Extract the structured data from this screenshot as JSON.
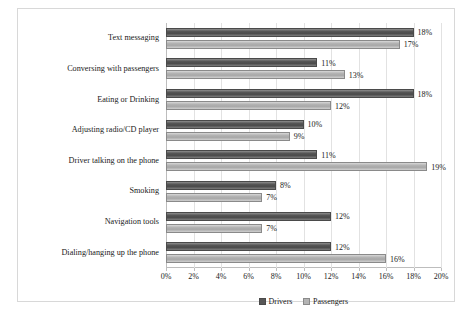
{
  "chart_data": {
    "type": "bar",
    "orientation": "horizontal",
    "title": "",
    "xlabel": "",
    "ylabel": "",
    "xlim": [
      0,
      20
    ],
    "xunit": "%",
    "grid": true,
    "legend_position": "bottom",
    "categories": [
      "Text messaging",
      "Conversing with passengers",
      "Eating or Drinking",
      "Adjusting radio/CD player",
      "Driver talking on the phone",
      "Smoking",
      "Navigation tools",
      "Dialing/hanging up the phone"
    ],
    "series": [
      {
        "name": "Drivers",
        "color": "#575757",
        "values": [
          18,
          11,
          18,
          10,
          11,
          8,
          12,
          12
        ],
        "labels": [
          "18%",
          "11%",
          "18%",
          "10%",
          "11%",
          "8%",
          "12%",
          "12%"
        ]
      },
      {
        "name": "Passengers",
        "color": "#b4b4b4",
        "values": [
          17,
          13,
          12,
          9,
          19,
          7,
          7,
          16
        ],
        "labels": [
          "17%",
          "13%",
          "12%",
          "9%",
          "19%",
          "7%",
          "7%",
          "16%"
        ]
      }
    ],
    "xticks": [
      0,
      2,
      4,
      6,
      8,
      10,
      12,
      14,
      16,
      18,
      20
    ],
    "xtick_labels": [
      "0%",
      "2%",
      "4%",
      "6%",
      "8%",
      "10%",
      "12%",
      "14%",
      "16%",
      "18%",
      "20%"
    ]
  },
  "legend": {
    "items": [
      {
        "label": "Drivers"
      },
      {
        "label": "Passengers"
      }
    ]
  },
  "caption": {
    "text": ""
  }
}
